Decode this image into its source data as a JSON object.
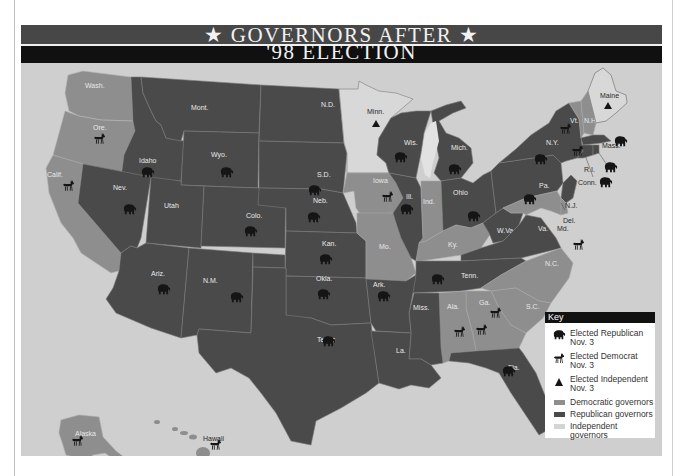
{
  "title": {
    "line1": "★  GOVERNORS AFTER  ★",
    "line2": "'98 ELECTION"
  },
  "colors": {
    "republican": "#4a4a4a",
    "democratic": "#8e8e8e",
    "independent": "#d8d8d8",
    "water": "#cfcfcf",
    "title_band": "#474747",
    "subtitle_band": "#101010"
  },
  "legend": {
    "title": "Key",
    "items": [
      {
        "icon": "elephant-icon",
        "label_line1": "Elected Republican",
        "label_line2": "Nov. 3"
      },
      {
        "icon": "donkey-icon",
        "label_line1": "Elected Democrat",
        "label_line2": "Nov. 3"
      },
      {
        "icon": "triangle-icon",
        "label_line1": "Elected Independent",
        "label_line2": "Nov. 3"
      },
      {
        "icon": "swatch-democratic",
        "label_line1": "Democratic governors"
      },
      {
        "icon": "swatch-republican",
        "label_line1": "Republican governors"
      },
      {
        "icon": "swatch-independent",
        "label_line1": "Independent governors"
      }
    ]
  },
  "states": {
    "wash": {
      "label": "Wash.",
      "party": "democratic",
      "elected": null
    },
    "ore": {
      "label": "Ore.",
      "party": "democratic",
      "elected": "democrat"
    },
    "calif": {
      "label": "Calif.",
      "party": "democratic",
      "elected": "democrat"
    },
    "idaho": {
      "label": "Idaho",
      "party": "republican",
      "elected": "republican"
    },
    "nev": {
      "label": "Nev.",
      "party": "republican",
      "elected": "republican"
    },
    "mont": {
      "label": "Mont.",
      "party": "republican",
      "elected": null
    },
    "wyo": {
      "label": "Wyo.",
      "party": "republican",
      "elected": "republican"
    },
    "utah": {
      "label": "Utah",
      "party": "republican",
      "elected": null
    },
    "ariz": {
      "label": "Ariz.",
      "party": "republican",
      "elected": "republican"
    },
    "colo": {
      "label": "Colo.",
      "party": "republican",
      "elected": "republican"
    },
    "nm": {
      "label": "N.M.",
      "party": "republican",
      "elected": "republican"
    },
    "nd": {
      "label": "N.D.",
      "party": "republican",
      "elected": null
    },
    "sd": {
      "label": "S.D.",
      "party": "republican",
      "elected": "republican"
    },
    "neb": {
      "label": "Neb.",
      "party": "republican",
      "elected": "republican"
    },
    "kan": {
      "label": "Kan.",
      "party": "republican",
      "elected": "republican"
    },
    "okla": {
      "label": "Okla.",
      "party": "republican",
      "elected": "republican"
    },
    "texas": {
      "label": "Texas",
      "party": "republican",
      "elected": "republican"
    },
    "minn": {
      "label": "Minn.",
      "party": "independent",
      "elected": "independent"
    },
    "iowa": {
      "label": "Iowa",
      "party": "democratic",
      "elected": "democrat"
    },
    "mo": {
      "label": "Mo.",
      "party": "democratic",
      "elected": null
    },
    "ark": {
      "label": "Ark.",
      "party": "republican",
      "elected": "republican"
    },
    "la": {
      "label": "La.",
      "party": "republican",
      "elected": null
    },
    "wis": {
      "label": "Wis.",
      "party": "republican",
      "elected": "republican"
    },
    "ill": {
      "label": "Ill.",
      "party": "republican",
      "elected": "republican"
    },
    "mich": {
      "label": "Mich.",
      "party": "republican",
      "elected": "republican"
    },
    "ind": {
      "label": "Ind.",
      "party": "democratic",
      "elected": null
    },
    "ohio": {
      "label": "Ohio",
      "party": "republican",
      "elected": "republican"
    },
    "ky": {
      "label": "Ky.",
      "party": "democratic",
      "elected": null
    },
    "tenn": {
      "label": "Tenn.",
      "party": "republican",
      "elected": "republican"
    },
    "miss": {
      "label": "Miss.",
      "party": "republican",
      "elected": null
    },
    "ala": {
      "label": "Ala.",
      "party": "democratic",
      "elected": "democrat"
    },
    "ga": {
      "label": "Ga.",
      "party": "democratic",
      "elected": "democrat"
    },
    "fla": {
      "label": "Fla.",
      "party": "republican",
      "elected": "republican"
    },
    "sc": {
      "label": "S.C.",
      "party": "democratic",
      "elected": "democrat"
    },
    "nc": {
      "label": "N.C.",
      "party": "democratic",
      "elected": null
    },
    "va": {
      "label": "Va.",
      "party": "republican",
      "elected": null
    },
    "wva": {
      "label": "W.Va.",
      "party": "republican",
      "elected": null
    },
    "pa": {
      "label": "Pa.",
      "party": "republican",
      "elected": "republican"
    },
    "ny": {
      "label": "N.Y.",
      "party": "republican",
      "elected": "republican"
    },
    "vt": {
      "label": "Vt.",
      "party": "democratic",
      "elected": "democrat"
    },
    "nh": {
      "label": "N.H.",
      "party": "democratic",
      "elected": "democrat"
    },
    "maine": {
      "label": "Maine",
      "party": "independent",
      "elected": "independent"
    },
    "mass": {
      "label": "Mass.",
      "party": "republican",
      "elected": "republican"
    },
    "ri": {
      "label": "R.I.",
      "party": "republican",
      "elected": "republican"
    },
    "conn": {
      "label": "Conn.",
      "party": "republican",
      "elected": "republican"
    },
    "nj": {
      "label": "N.J.",
      "party": "republican",
      "elected": null
    },
    "del": {
      "label": "Del.",
      "party": "democratic",
      "elected": null
    },
    "md": {
      "label": "Md.",
      "party": "democratic",
      "elected": "democrat"
    },
    "alaska": {
      "label": "Alaska",
      "party": "democratic",
      "elected": "democrat"
    },
    "hawaii": {
      "label": "Hawaii",
      "party": "democratic",
      "elected": "democrat"
    }
  }
}
